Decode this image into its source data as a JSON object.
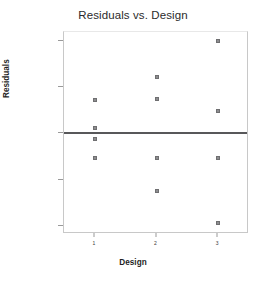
{
  "chart_data": {
    "type": "scatter",
    "title": "Residuals vs. Design",
    "xlabel": "Design",
    "ylabel": "Residuals",
    "grid": false,
    "legend": null,
    "xlim": [
      0.5,
      3.5
    ],
    "ylim": [
      -1.0,
      1.03
    ],
    "x_ticks": [
      1,
      2,
      3
    ],
    "x_tick_labels": [
      "1",
      "2",
      "3"
    ],
    "y_ticks": [
      0.942059,
      0.476292,
      0.0105142,
      -0.455263,
      -0.921041
    ],
    "y_tick_labels": [
      "0.942059",
      "0.476292",
      "0.0105142",
      "-0.455263",
      "-0.921041"
    ],
    "reference_line": {
      "orientation": "horizontal",
      "value": 0.0105142,
      "color": "#58585a"
    },
    "marker": {
      "shape": "square",
      "fill": "#8d8d8f",
      "edge": "#6f6f71"
    },
    "points": [
      {
        "x": 1,
        "y": 0.345
      },
      {
        "x": 1,
        "y": 0.068
      },
      {
        "x": 1,
        "y": -0.043
      },
      {
        "x": 1,
        "y": -0.235
      },
      {
        "x": 2,
        "y": 0.578
      },
      {
        "x": 2,
        "y": 0.355
      },
      {
        "x": 2,
        "y": -0.235
      },
      {
        "x": 2,
        "y": -0.569
      },
      {
        "x": 3,
        "y": 0.942
      },
      {
        "x": 3,
        "y": 0.234
      },
      {
        "x": 3,
        "y": -0.235
      },
      {
        "x": 3,
        "y": -0.893
      }
    ]
  }
}
